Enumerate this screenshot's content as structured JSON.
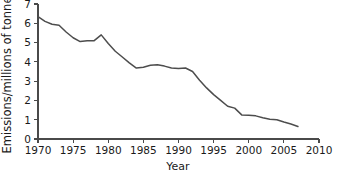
{
  "chart_data": {
    "type": "line",
    "title": "",
    "xlabel": "Year",
    "ylabel": "Emissions/millions of tonnes",
    "xlim": [
      1970,
      2010
    ],
    "ylim": [
      0,
      7
    ],
    "grid": false,
    "legend": null,
    "line_color": "#4d4d4d",
    "axis_color": "#4a4a4a",
    "background_color": "#ffffff",
    "xticks": [
      1970,
      1975,
      1980,
      1985,
      1990,
      1995,
      2000,
      2005,
      2010
    ],
    "xtick_labels": [
      "1970",
      "1975",
      "1980",
      "1985",
      "1990",
      "1995",
      "2000",
      "2005",
      "2010"
    ],
    "yticks": [
      0,
      1,
      2,
      3,
      4,
      5,
      6,
      7
    ],
    "ytick_labels": [
      "0",
      "1",
      "2",
      "3",
      "4",
      "5",
      "6",
      "7"
    ],
    "x": [
      1970,
      1971,
      1972,
      1973,
      1974,
      1975,
      1976,
      1977,
      1978,
      1979,
      1980,
      1981,
      1982,
      1983,
      1984,
      1985,
      1986,
      1987,
      1988,
      1989,
      1990,
      1991,
      1992,
      1993,
      1994,
      1995,
      1996,
      1997,
      1998,
      1999,
      2000,
      2001,
      2002,
      2003,
      2004,
      2005,
      2006,
      2007
    ],
    "values": [
      6.35,
      6.1,
      5.95,
      5.9,
      5.55,
      5.25,
      5.05,
      5.1,
      5.1,
      5.4,
      4.95,
      4.55,
      4.25,
      3.95,
      3.68,
      3.72,
      3.82,
      3.85,
      3.78,
      3.68,
      3.65,
      3.68,
      3.5,
      3.05,
      2.65,
      2.3,
      2.0,
      1.7,
      1.6,
      1.25,
      1.23,
      1.2,
      1.1,
      1.02,
      1.0,
      0.88,
      0.78,
      0.65
    ],
    "series_name": "Emissions"
  },
  "axis": {
    "x_title": "Year",
    "y_title": "Emissions/millions of tonnes"
  }
}
